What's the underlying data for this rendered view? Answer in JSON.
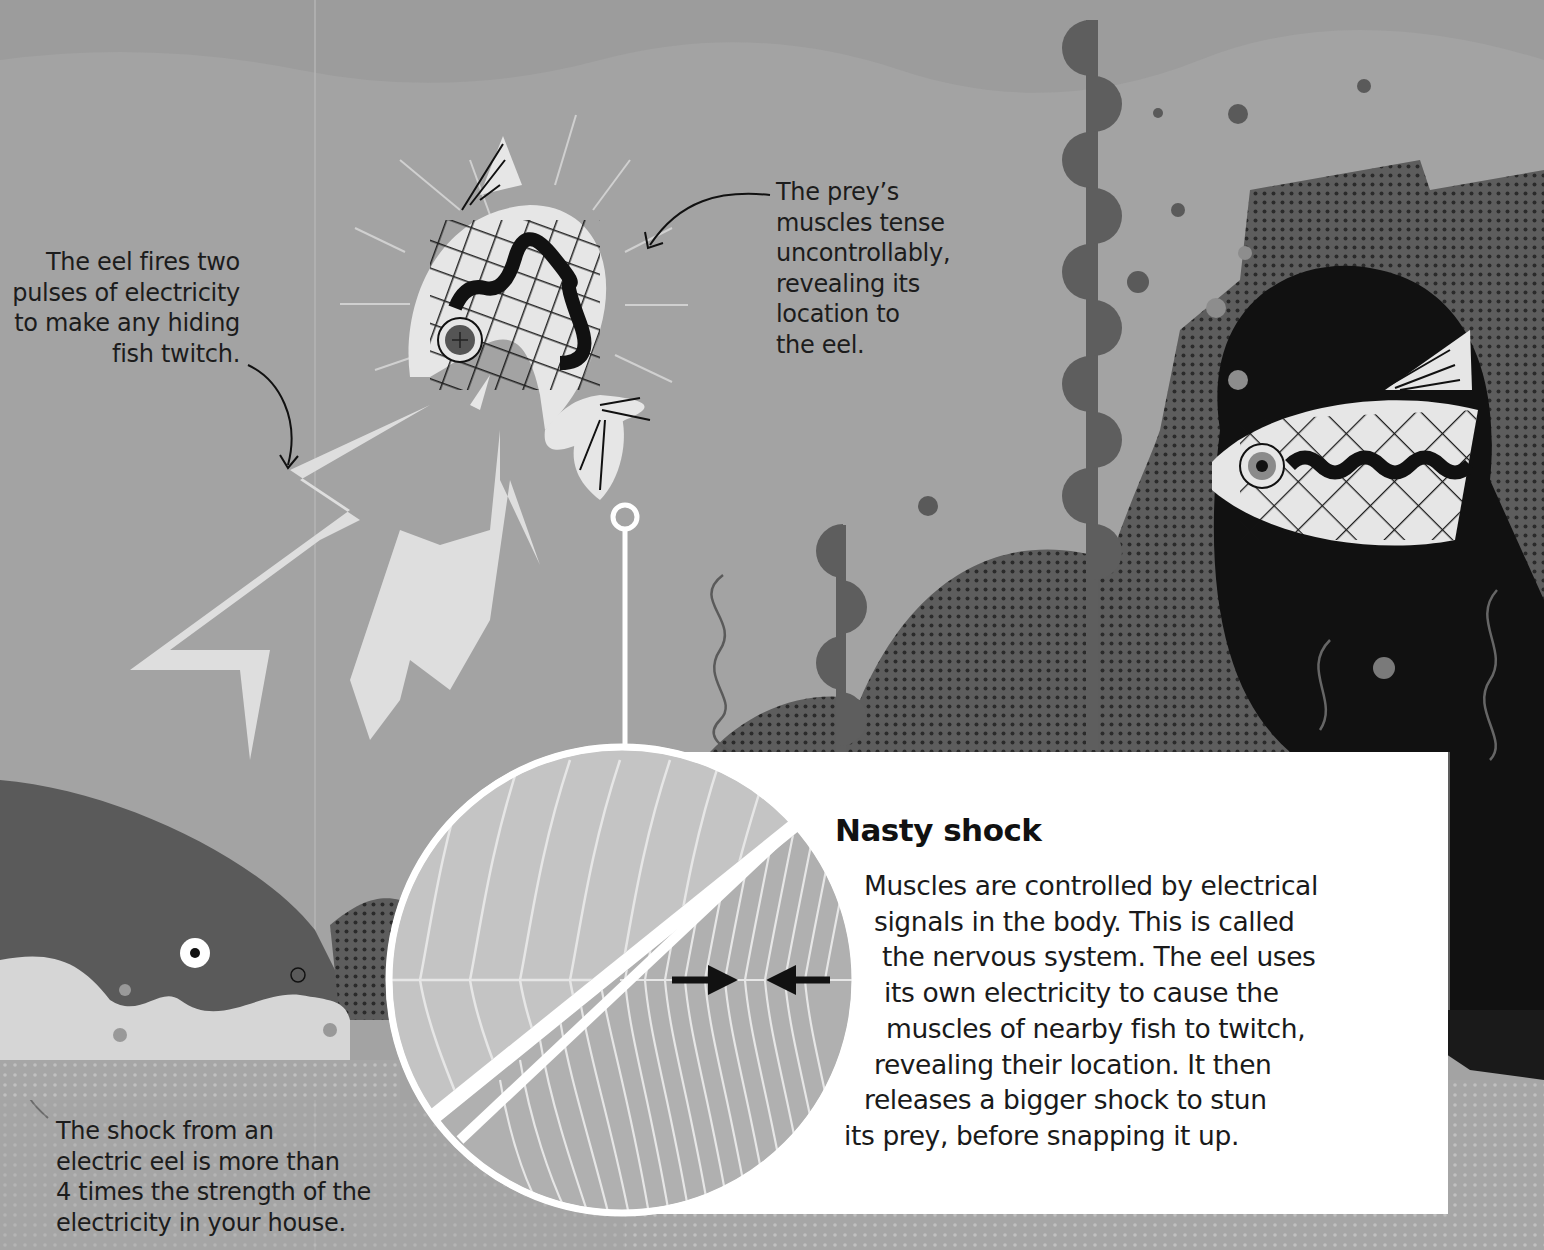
{
  "page": {
    "palette": {
      "background": "#a3a3a3",
      "water_light": "#adadad",
      "rock_dark": "#5c5c5c",
      "seaweed": "#5e5e5e",
      "cave_black": "#111111",
      "fish_body": "#e6e6e6",
      "bolt": "#dedede",
      "eel_body": "#5a5a5a",
      "panel_white": "#ffffff",
      "muscle_relaxed": "#c4c4c4",
      "muscle_contracted": "#b0b0b0",
      "text": "#1c1c1c"
    }
  },
  "captions": {
    "eel_pulses": {
      "lines": [
        "The eel fires two",
        "pulses of electricity",
        "to make any hiding",
        "fish twitch."
      ]
    },
    "prey_muscles": {
      "lines": [
        "The prey’s",
        "muscles tense",
        "uncontrollably,",
        "revealing its",
        "location to",
        "the eel."
      ]
    },
    "shock_strength": {
      "lines": [
        "The shock from an",
        "electric eel is more than",
        "4 times the strength of the",
        "electricity in your house."
      ]
    }
  },
  "info_panel": {
    "title": "Nasty shock",
    "body_lines": [
      "Muscles are controlled by electrical",
      "signals in the body. This is called",
      "the nervous system. The eel uses",
      "its own electricity to cause the",
      "muscles of nearby fish to twitch,",
      "revealing their location. It then",
      "releases a bigger shock to stun",
      "its prey, before snapping it up."
    ],
    "diagram": {
      "top_half": "relaxed muscle fibres",
      "bottom_half": "contracted muscle fibres",
      "arrows": "compression-arrows"
    }
  }
}
